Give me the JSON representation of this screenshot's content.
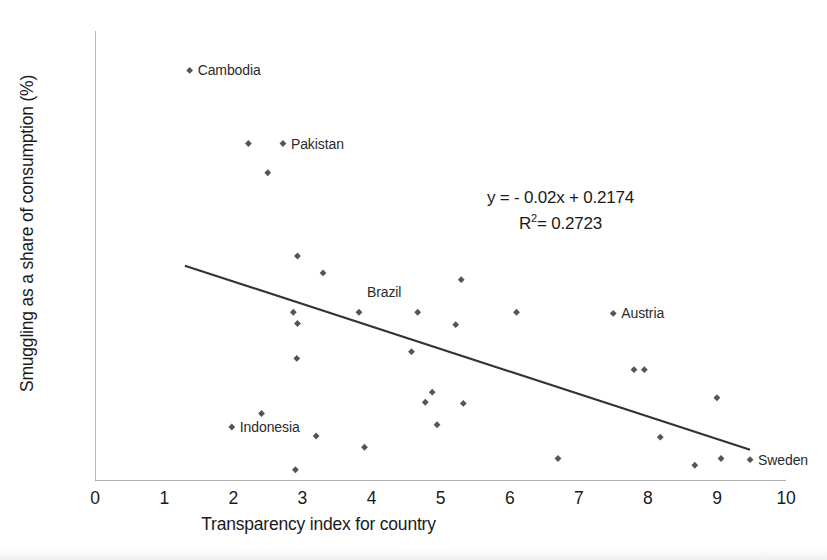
{
  "chart_data": {
    "type": "scatter",
    "title": "",
    "xlabel": "Transparency index for country",
    "ylabel": "Smuggling as a share of consumption (%)",
    "xlim": [
      0,
      10
    ],
    "ylim": [
      0.0,
      0.4
    ],
    "grid": false,
    "legend": "none",
    "xticks": [
      "0",
      "1",
      "2",
      "3",
      "4",
      "5",
      "6",
      "7",
      "8",
      "9",
      "10"
    ],
    "xtick_values": [
      0,
      1,
      2,
      3,
      4,
      5,
      6,
      7,
      8,
      9,
      10
    ],
    "yticks": [
      "0.00",
      "0.05",
      "0.10",
      "0.15",
      "0.20",
      "0.25",
      "0.30",
      "0.35",
      "0.40"
    ],
    "ytick_values": [
      0.0,
      0.05,
      0.1,
      0.15,
      0.2,
      0.25,
      0.3,
      0.35,
      0.4
    ],
    "marker_color": "#555555",
    "line_color": "#333333",
    "axis_color": "#9a9a9a",
    "points": [
      {
        "x": 1.37,
        "y": 0.365
      },
      {
        "x": 2.22,
        "y": 0.3
      },
      {
        "x": 2.72,
        "y": 0.3
      },
      {
        "x": 2.5,
        "y": 0.274
      },
      {
        "x": 2.93,
        "y": 0.2
      },
      {
        "x": 3.3,
        "y": 0.185
      },
      {
        "x": 5.3,
        "y": 0.179
      },
      {
        "x": 2.87,
        "y": 0.15
      },
      {
        "x": 3.82,
        "y": 0.15
      },
      {
        "x": 4.67,
        "y": 0.15
      },
      {
        "x": 6.1,
        "y": 0.15
      },
      {
        "x": 7.5,
        "y": 0.149
      },
      {
        "x": 2.93,
        "y": 0.14
      },
      {
        "x": 5.22,
        "y": 0.139
      },
      {
        "x": 4.58,
        "y": 0.115
      },
      {
        "x": 2.92,
        "y": 0.109
      },
      {
        "x": 7.8,
        "y": 0.099
      },
      {
        "x": 7.95,
        "y": 0.099
      },
      {
        "x": 9.0,
        "y": 0.074
      },
      {
        "x": 4.78,
        "y": 0.07
      },
      {
        "x": 5.33,
        "y": 0.069
      },
      {
        "x": 4.88,
        "y": 0.079
      },
      {
        "x": 2.41,
        "y": 0.06
      },
      {
        "x": 4.95,
        "y": 0.05
      },
      {
        "x": 1.98,
        "y": 0.048
      },
      {
        "x": 3.2,
        "y": 0.04
      },
      {
        "x": 8.18,
        "y": 0.039
      },
      {
        "x": 3.9,
        "y": 0.03
      },
      {
        "x": 9.06,
        "y": 0.02
      },
      {
        "x": 6.7,
        "y": 0.02
      },
      {
        "x": 9.48,
        "y": 0.019
      },
      {
        "x": 8.68,
        "y": 0.014
      },
      {
        "x": 2.9,
        "y": 0.01
      }
    ],
    "annotations": [
      {
        "label": "Cambodia",
        "x": 1.37,
        "y": 0.365
      },
      {
        "label": "Pakistan",
        "x": 2.72,
        "y": 0.3
      },
      {
        "label": "Brazil",
        "x": 3.82,
        "y": 0.168
      },
      {
        "label": "Austria",
        "x": 7.5,
        "y": 0.149
      },
      {
        "label": "Indonesia",
        "x": 1.98,
        "y": 0.048
      },
      {
        "label": "Sweden",
        "x": 9.48,
        "y": 0.019
      }
    ],
    "trendline": {
      "equation": "y = - 0.02x + 0.2174",
      "r_squared_label": "R",
      "r_squared_exponent": "2",
      "r_squared_value": "= 0.2723",
      "slope": -0.02,
      "intercept": 0.2174,
      "r_squared": 0.2723,
      "x_start": 1.3,
      "x_end": 9.48,
      "y_start": 0.1914,
      "y_end": 0.0278
    }
  }
}
